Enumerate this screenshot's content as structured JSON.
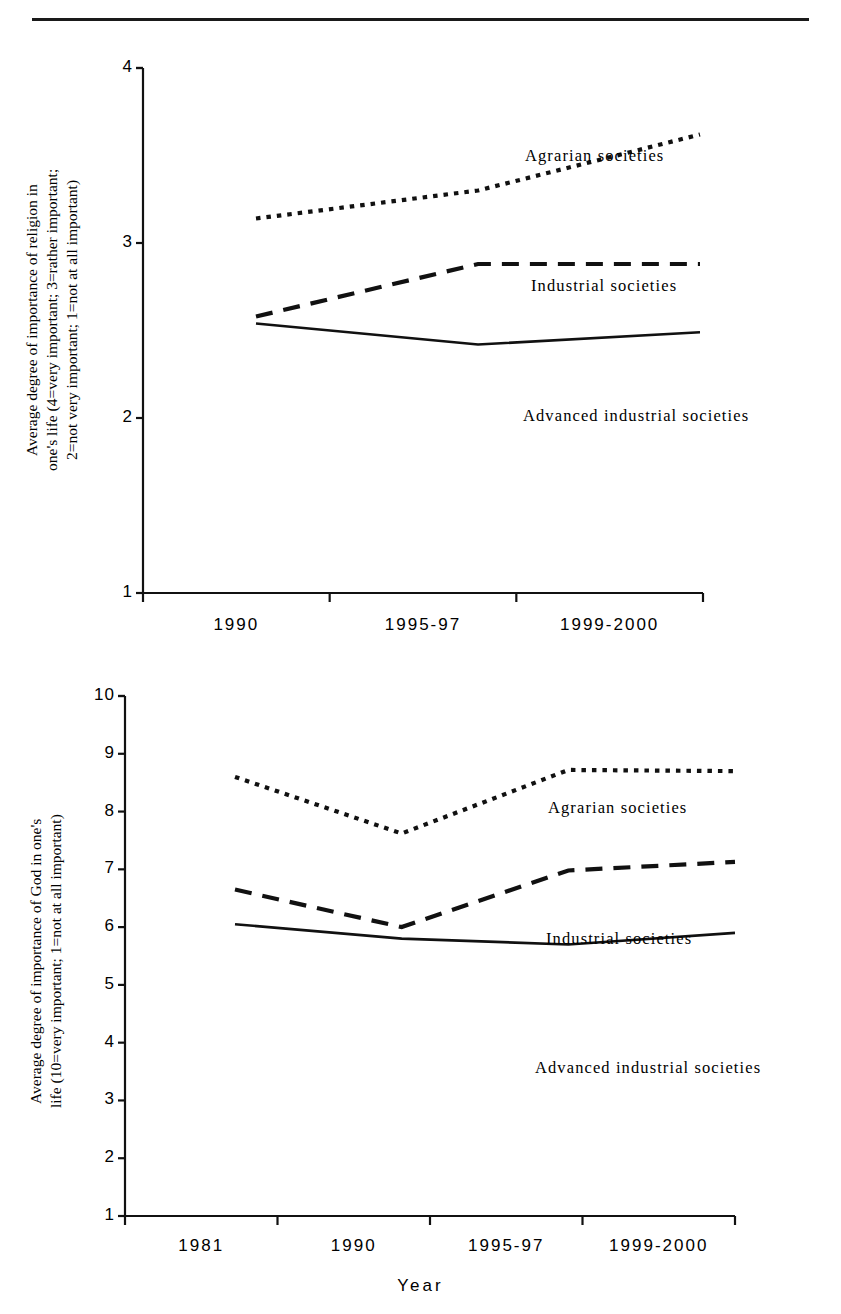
{
  "page": {
    "has_top_rule": true,
    "ink_color": "#111111",
    "background": "#ffffff"
  },
  "charts": [
    {
      "id": "religion-importance-chart",
      "ylabel": "Average degree of importance of religion in\none's life (4=very important; 3=rather important;\n2=not very important; 1=not at all important)",
      "xlabel": "",
      "ytick_labels": [
        "4",
        "3",
        "2",
        "1"
      ],
      "xtick_labels": [
        "1990",
        "1995-97",
        "1999-2000"
      ],
      "series_labels": {
        "agrarian": "Agrarian societies",
        "industrial": "Industrial societies",
        "advanced": "Advanced industrial societies"
      }
    },
    {
      "id": "god-importance-chart",
      "ylabel": "Average degree of importance of God in one's\nlife (10=very important; 1=not at all important)",
      "xlabel": "Year",
      "ytick_labels": [
        "10",
        "9",
        "8",
        "7",
        "6",
        "5",
        "4",
        "3",
        "2",
        "1"
      ],
      "xtick_labels": [
        "1981",
        "1990",
        "1995-97",
        "1999-2000"
      ],
      "series_labels": {
        "agrarian": "Agrarian societies",
        "industrial": "Industrial societies",
        "advanced": "Advanced industrial societies"
      }
    }
  ],
  "chart_data": [
    {
      "type": "line",
      "title": "",
      "xlabel": "",
      "ylabel": "Average degree of importance of religion in one's life (4=very important; 3=rather important; 2=not very important; 1=not at all important)",
      "categories": [
        "1990",
        "1995-97",
        "1999-2000"
      ],
      "ylim": [
        1,
        4
      ],
      "yticks": [
        1,
        2,
        3,
        4
      ],
      "grid": false,
      "legend": "inline-annotations",
      "series": [
        {
          "name": "Agrarian societies",
          "style": "dotted",
          "values": [
            3.14,
            3.3,
            3.62
          ]
        },
        {
          "name": "Industrial societies",
          "style": "dashed",
          "values": [
            2.58,
            2.88,
            2.88
          ]
        },
        {
          "name": "Advanced industrial societies",
          "style": "solid",
          "values": [
            2.54,
            2.42,
            2.49
          ]
        }
      ]
    },
    {
      "type": "line",
      "title": "",
      "xlabel": "Year",
      "ylabel": "Average degree of importance of God in one's life (10=very important; 1=not at all important)",
      "categories": [
        "1981",
        "1990",
        "1995-97",
        "1999-2000"
      ],
      "ylim": [
        1,
        10
      ],
      "yticks": [
        1,
        2,
        3,
        4,
        5,
        6,
        7,
        8,
        9,
        10
      ],
      "grid": false,
      "legend": "inline-annotations",
      "series": [
        {
          "name": "Agrarian societies",
          "style": "dotted",
          "values": [
            8.6,
            7.62,
            8.72,
            8.7
          ]
        },
        {
          "name": "Industrial societies",
          "style": "dashed",
          "values": [
            6.65,
            6.0,
            6.98,
            7.13
          ]
        },
        {
          "name": "Advanced industrial societies",
          "style": "solid",
          "values": [
            6.05,
            5.8,
            5.7,
            5.9
          ]
        }
      ]
    }
  ]
}
